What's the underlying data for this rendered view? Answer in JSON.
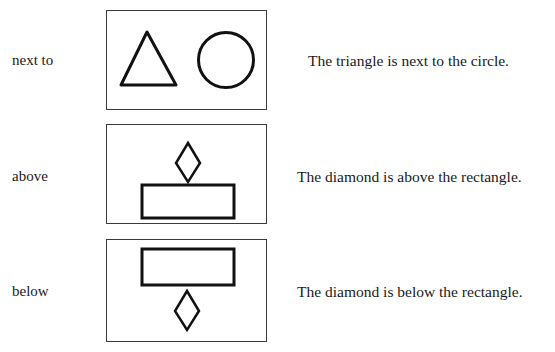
{
  "rows": [
    {
      "relation": "next to",
      "sentence": "The triangle is next to the circle.",
      "shapes": [
        "triangle",
        "circle"
      ]
    },
    {
      "relation": "above",
      "sentence": "The diamond is above the rectangle.",
      "shapes": [
        "diamond",
        "rectangle"
      ]
    },
    {
      "relation": "below",
      "sentence": "The diamond is below the rectangle.",
      "shapes": [
        "rectangle",
        "diamond"
      ]
    }
  ],
  "colors": {
    "stroke": "#111111",
    "frame": "#3a3a3a",
    "background": "#ffffff"
  }
}
